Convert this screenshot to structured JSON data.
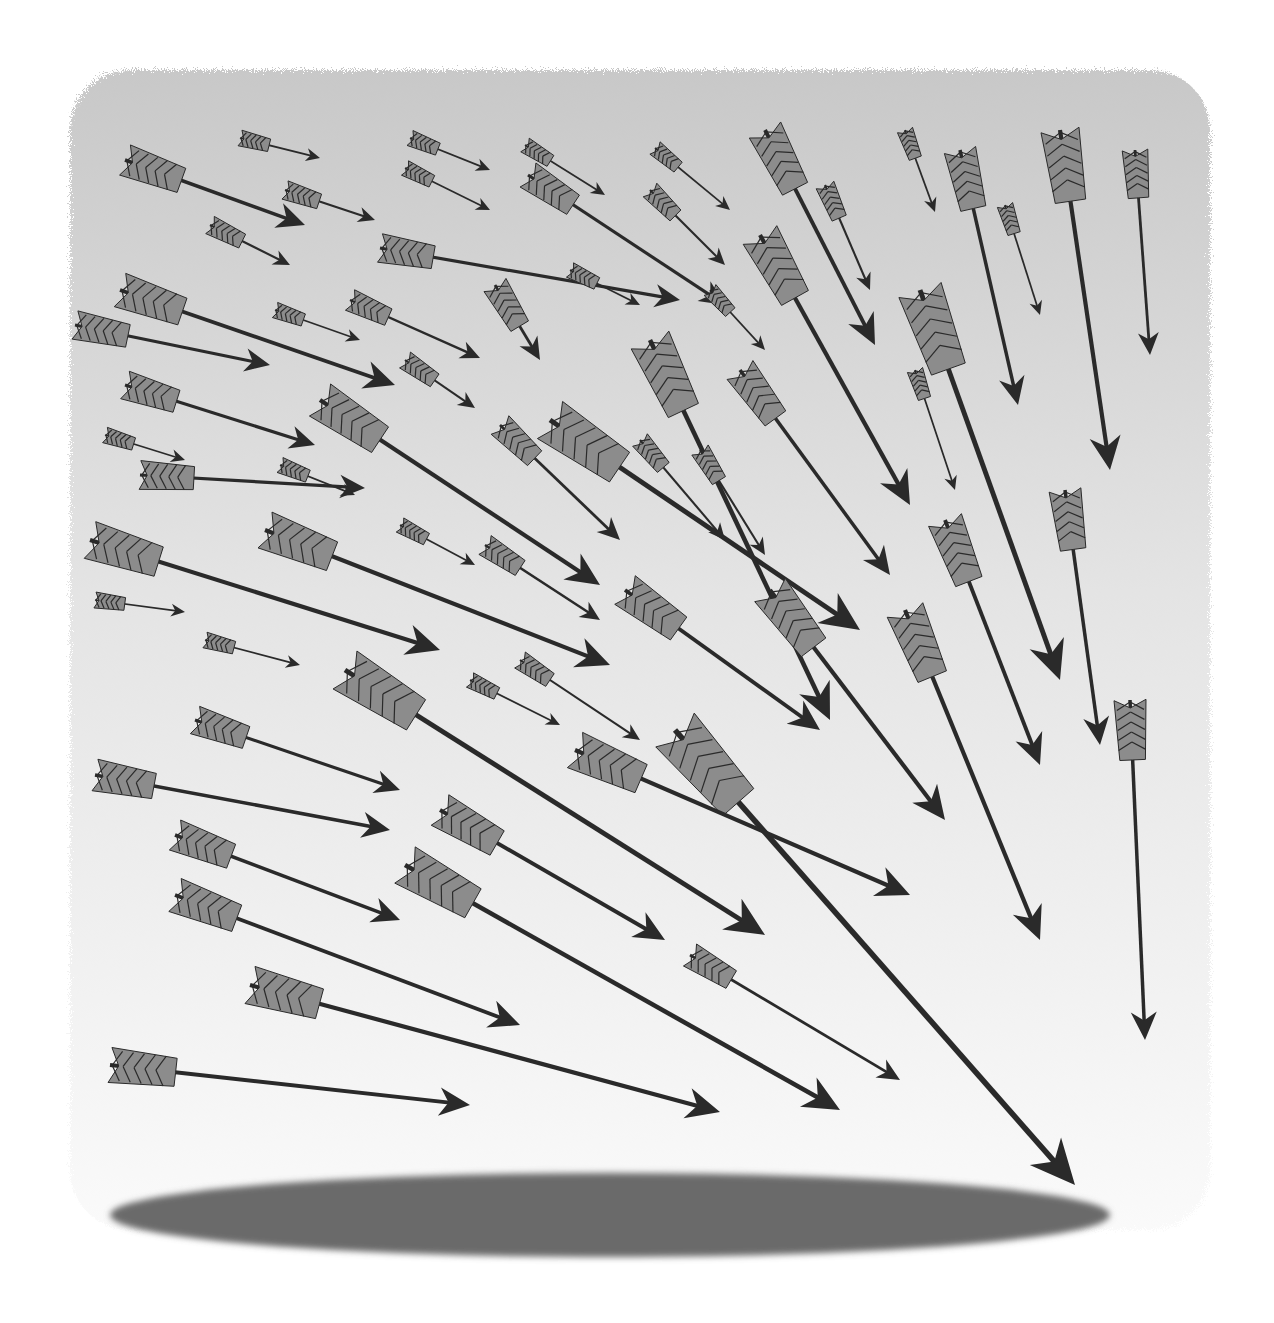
{
  "illustration": {
    "title": "Arrows converging toward a point",
    "background": {
      "top_color": "#c8c8c8",
      "bottom_color": "#fafafa",
      "paper": "#ffffff"
    },
    "ground_shadow": {
      "color": "#6a6a6a",
      "cx": 610,
      "cy": 1215,
      "rx": 500,
      "ry": 42
    },
    "ink": "#2a2a2a",
    "fletch_light": "#8c8c8c",
    "arrows": [
      [
        125,
        160,
        305,
        225,
        1.0
      ],
      [
        240,
        138,
        320,
        158,
        0.5
      ],
      [
        285,
        190,
        375,
        220,
        0.6
      ],
      [
        210,
        225,
        290,
        265,
        0.6
      ],
      [
        410,
        138,
        490,
        170,
        0.5
      ],
      [
        405,
        168,
        490,
        210,
        0.5
      ],
      [
        525,
        145,
        605,
        195,
        0.5
      ],
      [
        528,
        175,
        725,
        305,
        0.9
      ],
      [
        655,
        148,
        730,
        210,
        0.5
      ],
      [
        650,
        190,
        725,
        265,
        0.6
      ],
      [
        765,
        130,
        875,
        345,
        1.1
      ],
      [
        825,
        185,
        870,
        290,
        0.6
      ],
      [
        905,
        130,
        935,
        212,
        0.5
      ],
      [
        960,
        150,
        1018,
        405,
        1.0
      ],
      [
        1005,
        205,
        1040,
        315,
        0.5
      ],
      [
        1060,
        130,
        1110,
        470,
        1.2
      ],
      [
        1135,
        150,
        1150,
        355,
        0.8
      ],
      [
        120,
        290,
        395,
        385,
        1.1
      ],
      [
        75,
        325,
        270,
        365,
        0.9
      ],
      [
        275,
        310,
        360,
        340,
        0.5
      ],
      [
        350,
        300,
        480,
        358,
        0.7
      ],
      [
        380,
        248,
        680,
        300,
        0.9
      ],
      [
        495,
        285,
        540,
        360,
        0.8
      ],
      [
        570,
        270,
        640,
        305,
        0.5
      ],
      [
        710,
        290,
        765,
        350,
        0.5
      ],
      [
        760,
        235,
        910,
        505,
        1.2
      ],
      [
        920,
        290,
        1060,
        680,
        1.4
      ],
      [
        915,
        370,
        955,
        490,
        0.5
      ],
      [
        125,
        385,
        315,
        445,
        0.9
      ],
      [
        105,
        435,
        185,
        460,
        0.5
      ],
      [
        140,
        475,
        365,
        488,
        0.9
      ],
      [
        280,
        465,
        355,
        495,
        0.5
      ],
      [
        320,
        400,
        600,
        585,
        1.2
      ],
      [
        405,
        360,
        475,
        408,
        0.6
      ],
      [
        500,
        425,
        620,
        540,
        0.8
      ],
      [
        550,
        420,
        860,
        630,
        1.4
      ],
      [
        640,
        440,
        725,
        540,
        0.6
      ],
      [
        650,
        340,
        830,
        720,
        1.3
      ],
      [
        700,
        450,
        765,
        555,
        0.6
      ],
      [
        740,
        370,
        890,
        575,
        1.0
      ],
      [
        90,
        540,
        440,
        650,
        1.2
      ],
      [
        95,
        600,
        185,
        612,
        0.5
      ],
      [
        265,
        530,
        610,
        665,
        1.2
      ],
      [
        400,
        525,
        475,
        565,
        0.5
      ],
      [
        485,
        545,
        600,
        620,
        0.7
      ],
      [
        625,
        590,
        820,
        730,
        1.1
      ],
      [
        770,
        590,
        945,
        820,
        1.2
      ],
      [
        945,
        520,
        1040,
        765,
        1.1
      ],
      [
        1065,
        490,
        1100,
        745,
        1.0
      ],
      [
        905,
        610,
        1040,
        940,
        1.2
      ],
      [
        1130,
        700,
        1145,
        1040,
        1.0
      ],
      [
        205,
        640,
        300,
        665,
        0.5
      ],
      [
        345,
        670,
        765,
        935,
        1.4
      ],
      [
        520,
        660,
        640,
        740,
        0.6
      ],
      [
        470,
        680,
        560,
        725,
        0.5
      ],
      [
        675,
        730,
        1075,
        1185,
        1.6
      ],
      [
        575,
        750,
        910,
        895,
        1.2
      ],
      [
        195,
        720,
        400,
        790,
        0.9
      ],
      [
        95,
        775,
        390,
        830,
        1.0
      ],
      [
        175,
        835,
        400,
        920,
        1.0
      ],
      [
        440,
        810,
        665,
        940,
        1.1
      ],
      [
        405,
        865,
        840,
        1110,
        1.3
      ],
      [
        175,
        895,
        520,
        1025,
        1.1
      ],
      [
        690,
        955,
        900,
        1080,
        0.8
      ],
      [
        250,
        985,
        720,
        1112,
        1.2
      ],
      [
        110,
        1065,
        470,
        1105,
        1.1
      ]
    ]
  }
}
